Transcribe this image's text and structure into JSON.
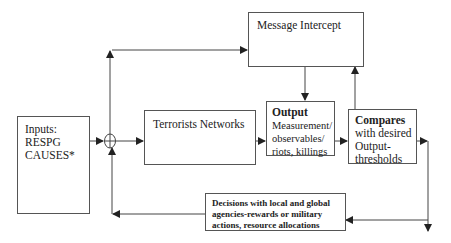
{
  "diagram": {
    "type": "feedback control loop block diagram",
    "nodes": {
      "inputs": {
        "label_line1": "Inputs:",
        "label_line2": "RESPG",
        "label_line3": "CAUSES*"
      },
      "summing_junction": {
        "symbol": "⊕"
      },
      "message_intercept": {
        "label": "Message Intercept"
      },
      "terrorists_networks": {
        "label": "Terrorists Networks"
      },
      "output": {
        "title": "Output",
        "line1": "Measurement/",
        "line2": "observables/",
        "line3": "riots, killings"
      },
      "compares": {
        "title": "Compares",
        "line1": "with desired",
        "line2": "Output-",
        "line3": "thresholds"
      },
      "decisions": {
        "line1": "Decisions with local and global",
        "line2": "agencies-rewards or military",
        "line3": "actions, resource allocations"
      }
    },
    "edges": [
      {
        "from": "inputs",
        "to": "summing_junction"
      },
      {
        "from": "summing_junction",
        "to": "terrorists_networks"
      },
      {
        "from": "summing_junction",
        "to": "message_intercept"
      },
      {
        "from": "message_intercept",
        "to": "output"
      },
      {
        "from": "terrorists_networks",
        "to": "output"
      },
      {
        "from": "output",
        "to": "compares"
      },
      {
        "from": "compares",
        "to": "message_intercept"
      },
      {
        "from": "compares",
        "to": "decisions"
      },
      {
        "from": "compares",
        "to": "exit-down"
      },
      {
        "from": "decisions",
        "to": "summing_junction"
      }
    ],
    "colors": {
      "line": "#444444",
      "box_border": "#555555",
      "text": "#222222"
    }
  }
}
